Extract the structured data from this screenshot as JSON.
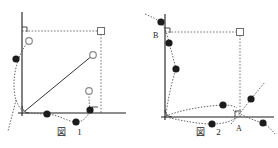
{
  "document": {
    "kind": "geometry-figure-pair",
    "background_color": "#ffffff",
    "ink_color": "#1c1c1c",
    "dash_color": "#555555",
    "open_marker_color": "#8a8a8a"
  },
  "figures": [
    {
      "id": "figure-1",
      "caption_label": "図",
      "caption_index": "1",
      "axes": {
        "vertical_axis": {
          "x": 22,
          "y_top": 12,
          "y_bottom": 116
        },
        "horizontal_axis": {
          "y": 113,
          "x_left": 18,
          "x_right": 126
        }
      },
      "right_angle_marks": [
        {
          "name": "upper-left-right-angle",
          "x": 22,
          "y": 33
        },
        {
          "name": "lower-right-right-angle",
          "x": 97,
          "y": 113
        }
      ],
      "angle_arc": {
        "name": "origin-angle-arc",
        "x": 24,
        "y": 113,
        "radius": 7
      },
      "square_node": {
        "name": "corner-square-node",
        "x": 101,
        "y": 31
      },
      "dashed_rectangle": {
        "name": "dashed-bounding-box",
        "x1": 22,
        "y1": 31,
        "x2": 101,
        "y2": 113
      },
      "solid_segment": {
        "name": "diagonal-segment",
        "x1": 25,
        "y1": 111,
        "x2": 93,
        "y2": 55
      },
      "open_points": [
        {
          "name": "open-point-upper-left",
          "x": 29,
          "y": 41
        },
        {
          "name": "open-point-diagonal-end",
          "x": 93,
          "y": 55
        },
        {
          "name": "open-point-lower-right",
          "x": 89,
          "y": 91
        }
      ],
      "filled_points": [
        {
          "name": "filled-point-left-upper",
          "x": 16,
          "y": 59
        },
        {
          "name": "filled-point-baseline-mid",
          "x": 47,
          "y": 114
        },
        {
          "name": "filled-point-baseline-low",
          "x": 76,
          "y": 122
        },
        {
          "name": "filled-point-right-lower",
          "x": 90,
          "y": 110
        }
      ],
      "dotted_curves": [
        {
          "name": "left-arc-curve"
        },
        {
          "name": "baseline-wave-curve"
        },
        {
          "name": "right-hook-curve"
        }
      ]
    },
    {
      "id": "figure-2",
      "caption_label": "図",
      "caption_index": "2",
      "axes": {
        "vertical_axis": {
          "x": 26,
          "y_top": 14,
          "y_bottom": 117
        },
        "horizontal_axis": {
          "y": 117,
          "x_left": 22,
          "x_right": 135
        }
      },
      "point_labels": [
        {
          "name": "point-label-b",
          "text": "B",
          "x": 16,
          "y": 35
        },
        {
          "name": "point-label-a",
          "text": "A",
          "x": 100,
          "y": 128
        }
      ],
      "right_angle_marks": [
        {
          "name": "upper-left-right-angle",
          "x": 26,
          "y": 34
        },
        {
          "name": "point-a-right-angle",
          "x": 96,
          "y": 117
        }
      ],
      "angle_arc": {
        "name": "origin-angle-arc",
        "x": 28,
        "y": 117,
        "radius": 7
      },
      "square_node": {
        "name": "corner-square-node",
        "x": 101,
        "y": 32
      },
      "dashed_rectangle": {
        "name": "dashed-bounding-box",
        "x1": 26,
        "y1": 32,
        "x2": 101,
        "y2": 117
      },
      "filled_points": [
        {
          "name": "filled-point-above-b",
          "x": 22,
          "y": 22
        },
        {
          "name": "filled-point-below-b",
          "x": 30,
          "y": 43
        },
        {
          "name": "filled-point-left-mid",
          "x": 37,
          "y": 69
        },
        {
          "name": "filled-point-inner-right",
          "x": 84,
          "y": 105
        },
        {
          "name": "filled-point-upper-right",
          "x": 112,
          "y": 99
        },
        {
          "name": "filled-point-baseline-low",
          "x": 73,
          "y": 124
        },
        {
          "name": "filled-point-outer-right",
          "x": 124,
          "y": 123
        }
      ],
      "dotted_curves": [
        {
          "name": "left-descending-curve"
        },
        {
          "name": "upper-chord-curve"
        },
        {
          "name": "lower-chord-curve"
        },
        {
          "name": "through-a-diagonal-up"
        },
        {
          "name": "through-a-diagonal-down"
        }
      ]
    }
  ]
}
